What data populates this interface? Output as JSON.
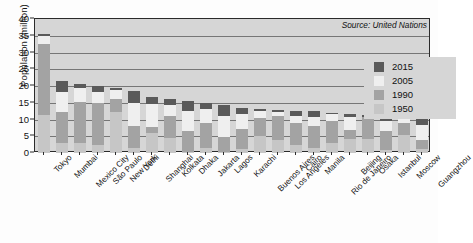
{
  "chart_data": {
    "type": "bar",
    "title": "",
    "subtitle": "",
    "xlabel": "",
    "ylabel": "Population (million)",
    "ylim": [
      0,
      40
    ],
    "yticks": [
      0,
      5,
      10,
      15,
      20,
      25,
      30,
      35,
      40
    ],
    "ytick_labels": [
      "0",
      "5",
      "10",
      "15",
      "20",
      "25",
      "30",
      "35",
      "40"
    ],
    "grid": true,
    "grid_axis": "y",
    "legend_position": "top-right",
    "annotation": "Source: United Nations",
    "bar_style": "overlapping-vertical-bands",
    "categories": [
      "Tokyo",
      "Mumbai",
      "Mexico City",
      "São Paulo",
      "New York",
      "Delhi",
      "Shanghai",
      "Kolkata",
      "Dhaka",
      "Jakarta",
      "Lagos",
      "Karachi",
      "Buenos Aires",
      "Los Angeles",
      "Cairo",
      "Manila",
      "Rio de Janeiro",
      "Beijing",
      "Osaka",
      "Istanbul",
      "Moscow",
      "Guangzhou"
    ],
    "series": [
      {
        "name": "2015",
        "color": "#5a5a5a",
        "values": [
          35.5,
          21.4,
          20.6,
          20.0,
          19.4,
          18.6,
          16.7,
          16.0,
          15.6,
          14.9,
          14.4,
          13.5,
          13.2,
          12.9,
          12.5,
          12.4,
          12.0,
          11.7,
          11.3,
          10.9,
          10.8,
          10.4
        ]
      },
      {
        "name": "2005",
        "color": "#efefef",
        "values": [
          34.8,
          18.2,
          19.4,
          18.3,
          18.7,
          15.0,
          14.5,
          14.3,
          12.4,
          13.2,
          11.1,
          11.6,
          12.6,
          12.3,
          11.1,
          10.7,
          11.5,
          10.7,
          11.3,
          9.7,
          10.4,
          8.4
        ]
      },
      {
        "name": "1990",
        "color": "#a3a3a3",
        "values": [
          32.5,
          12.3,
          15.3,
          14.8,
          16.1,
          8.2,
          7.8,
          10.9,
          6.6,
          9.0,
          4.8,
          7.1,
          10.5,
          10.9,
          9.1,
          8.0,
          9.6,
          6.8,
          11.0,
          6.5,
          8.9,
          3.9
        ]
      },
      {
        "name": "1950",
        "color": "#c6c6c6",
        "values": [
          11.3,
          2.9,
          3.1,
          2.3,
          12.3,
          1.4,
          6.1,
          4.5,
          0.3,
          1.5,
          0.3,
          1.1,
          5.1,
          4.0,
          2.5,
          1.5,
          3.0,
          4.3,
          4.1,
          1.0,
          5.4,
          1.3
        ]
      }
    ]
  },
  "legend": {
    "items": [
      {
        "label": "2015",
        "color": "#5a5a5a"
      },
      {
        "label": "2005",
        "color": "#efefef"
      },
      {
        "label": "1990",
        "color": "#a3a3a3"
      },
      {
        "label": "1950",
        "color": "#c6c6c6"
      }
    ]
  },
  "source_note": "Source: United Nations"
}
